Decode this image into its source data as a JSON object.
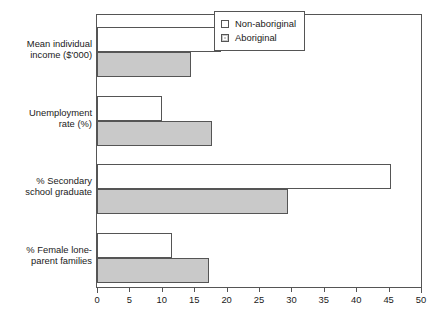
{
  "chart_data": {
    "type": "bar",
    "orientation": "horizontal",
    "title": "",
    "xlabel": "",
    "ylabel": "",
    "xlim": [
      0,
      50
    ],
    "xticks": [
      0,
      5,
      10,
      15,
      20,
      25,
      30,
      35,
      40,
      45,
      50
    ],
    "grid": false,
    "legend_position": "top-right",
    "categories": [
      "Mean individual income ($'000)",
      "Unemployment rate (%)",
      "% Secondary school graduate",
      "% Female lone-parent families"
    ],
    "category_lines": [
      [
        "Mean individual",
        "income ($'000)"
      ],
      [
        "Unemployment",
        "rate (%)"
      ],
      [
        "% Secondary",
        "school graduate"
      ],
      [
        "% Female lone-",
        "parent families"
      ]
    ],
    "series": [
      {
        "name": "Non-aboriginal",
        "color": "#ffffff",
        "values": [
          19.2,
          10.0,
          45.3,
          11.5
        ]
      },
      {
        "name": "Aboriginal",
        "color": "#c9c9c9",
        "values": [
          14.5,
          17.8,
          29.4,
          17.3
        ]
      }
    ]
  },
  "legend": {
    "items": [
      {
        "label": "Non-aboriginal",
        "swatch": "white-square-icon"
      },
      {
        "label": "Aboriginal",
        "swatch": "gray-square-icon"
      }
    ]
  },
  "axis": {
    "x_tick_labels": [
      "0",
      "5",
      "10",
      "15",
      "20",
      "25",
      "30",
      "35",
      "40",
      "45",
      "50"
    ]
  },
  "colors": {
    "non_aboriginal_fill": "#ffffff",
    "aboriginal_fill": "#c9c9c9",
    "line": "#555555",
    "text": "#1a1a1a",
    "background": "#ffffff"
  }
}
